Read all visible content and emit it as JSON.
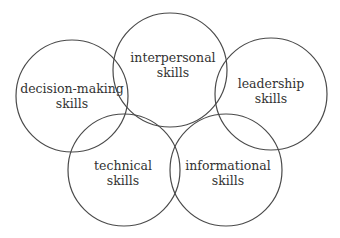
{
  "diagram": {
    "type": "overlapping-circles",
    "line_color": "#4a4a4a",
    "text_color": "#333333",
    "circles": [
      {
        "id": "decision-making",
        "line1": "decision-making",
        "line2": "skills",
        "cx": 72,
        "cy": 96,
        "r": 56
      },
      {
        "id": "interpersonal",
        "line1": "interpersonal",
        "line2": "skills",
        "cx": 170,
        "cy": 70,
        "r": 57
      },
      {
        "id": "leadership",
        "line1": "leadership",
        "line2": "skills",
        "cx": 271,
        "cy": 94,
        "r": 56
      },
      {
        "id": "technical",
        "line1": "technical",
        "line2": "skills",
        "cx": 124,
        "cy": 170,
        "r": 56
      },
      {
        "id": "informational",
        "line1": "informational",
        "line2": "skills",
        "cx": 226,
        "cy": 170,
        "r": 56
      }
    ]
  }
}
